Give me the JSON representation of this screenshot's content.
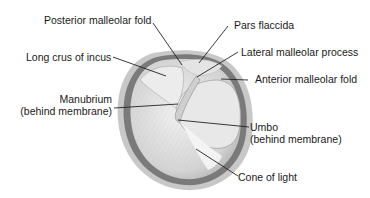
{
  "diagram": {
    "colors": {
      "text": "#1a1a1a",
      "leader": "#222222",
      "rim_dark": "#6e6e6e",
      "rim_mid": "#a8a8a8",
      "membrane": "#dcdcdc",
      "background": "#ffffff"
    },
    "labels": {
      "posterior_malleolar_fold": "Posterior malleolar fold",
      "pars_flaccida": "Pars flaccida",
      "long_crus_of_incus": "Long crus of incus",
      "lateral_malleolar_process": "Lateral malleolar process",
      "anterior_malleolar_fold": "Anterior malleolar fold",
      "manubrium_line1": "Manubrium",
      "manubrium_line2": "(behind membrane)",
      "umbo_line1": "Umbo",
      "umbo_line2": "(behind membrane)",
      "cone_of_light": "Cone of light"
    }
  }
}
